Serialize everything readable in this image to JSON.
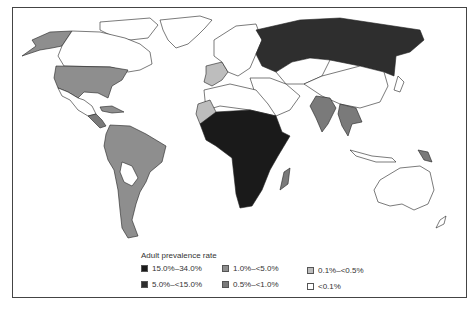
{
  "map": {
    "title": "Adult prevalence rate",
    "legend": {
      "title": "Adult prevalence rate",
      "items": [
        {
          "label": "15.0%–34.0%",
          "color": "#1a1a1a"
        },
        {
          "label": "5.0%–<15.0%",
          "color": "#2e2e2e"
        },
        {
          "label": "1.0%–<5.0%",
          "color": "#8e8e8e"
        },
        {
          "label": "0.5%–<1.0%",
          "color": "#7a7a7a"
        },
        {
          "label": "0.1%–<0.5%",
          "color": "#bdbdbd"
        },
        {
          "label": "<0.1%",
          "color": "#ffffff"
        }
      ]
    },
    "regions": [
      {
        "name": "Alaska",
        "class": "1.0%–<5.0%"
      },
      {
        "name": "United States",
        "class": "1.0%–<5.0%"
      },
      {
        "name": "Canada",
        "class": "<0.1%"
      },
      {
        "name": "Greenland",
        "class": "<0.1%"
      },
      {
        "name": "Mexico",
        "class": "<0.1%"
      },
      {
        "name": "Central America",
        "class": "0.5%–<1.0%"
      },
      {
        "name": "South America",
        "class": "1.0%–<5.0%"
      },
      {
        "name": "Sub-Saharan Africa",
        "class": "15.0%–34.0%"
      },
      {
        "name": "Western Sahara/Mauritania",
        "class": "0.1%–<0.5%"
      },
      {
        "name": "North Africa",
        "class": "<0.1%"
      },
      {
        "name": "Madagascar",
        "class": "0.5%–<1.0%"
      },
      {
        "name": "Russia",
        "class": "5.0%–<15.0%"
      },
      {
        "name": "Ukraine",
        "class": "5.0%–<15.0%"
      },
      {
        "name": "Spain/France",
        "class": "0.1%–<0.5%"
      },
      {
        "name": "Europe",
        "class": "<0.1%"
      },
      {
        "name": "Middle East",
        "class": "<0.1%"
      },
      {
        "name": "China",
        "class": "<0.1%"
      },
      {
        "name": "India",
        "class": "0.5%–<1.0%"
      },
      {
        "name": "Southeast Asia",
        "class": "0.5%–<1.0%"
      },
      {
        "name": "Papua New Guinea",
        "class": "0.5%–<1.0%"
      },
      {
        "name": "Australia",
        "class": "<0.1%"
      }
    ]
  }
}
